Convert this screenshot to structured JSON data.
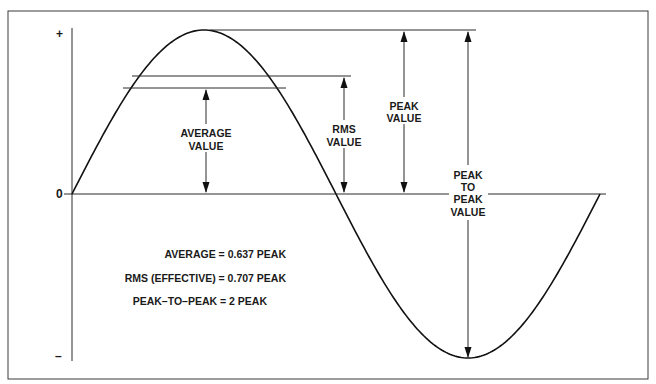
{
  "diagram": {
    "type": "sine-wave-ac-values",
    "axis": {
      "plus_label": "+",
      "zero_label": "0",
      "minus_label": "–"
    },
    "annotations": {
      "average_value": [
        "AVERAGE",
        "VALUE"
      ],
      "rms_value": [
        "RMS",
        "VALUE"
      ],
      "peak_value": [
        "PEAK",
        "VALUE"
      ],
      "peak_to_peak_value": [
        "PEAK",
        "TO",
        "PEAK",
        "VALUE"
      ]
    },
    "formulas": [
      "AVERAGE = 0.637 PEAK",
      "RMS (EFFECTIVE) = 0.707 PEAK",
      "PEAK–TO–PEAK = 2 PEAK"
    ],
    "relations": {
      "average_factor": 0.637,
      "rms_factor": 0.707,
      "peak_to_peak_factor": 2
    },
    "colors": {
      "line": "#2a2a2a",
      "background": "#ffffff"
    }
  }
}
